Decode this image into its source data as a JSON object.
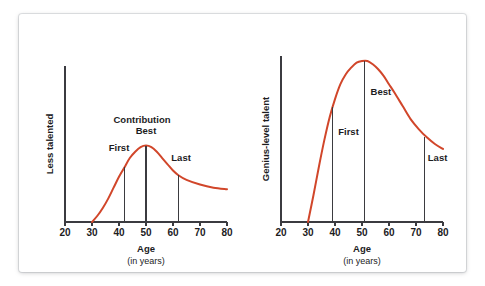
{
  "figure": {
    "background_color": "#ffffff",
    "card_color": "#ffffff",
    "curve_color": "#d1462a",
    "axis_color": "#3b3b40",
    "text_color": "#1c1c1e"
  },
  "chart_data": [
    {
      "type": "line",
      "panel": "left",
      "title": "",
      "xlabel": "Age",
      "xlabel_sub": "(in years)",
      "ylabel": "Less talented",
      "region_label": "Contribution",
      "xlim": [
        20,
        80
      ],
      "ylim": [
        0,
        100
      ],
      "grid": false,
      "legend": "none",
      "xticks": [
        20,
        30,
        40,
        50,
        60,
        70,
        80
      ],
      "xtick_labels": [
        "20",
        "30",
        "40",
        "50",
        "60",
        "70",
        "80"
      ],
      "yticks": [],
      "ytick_labels": [],
      "x": [
        30,
        32,
        34,
        36,
        38,
        40,
        42,
        44,
        46,
        48,
        50,
        52,
        54,
        56,
        58,
        60,
        62,
        65,
        70,
        75,
        80
      ],
      "values": [
        0,
        4,
        9,
        15,
        22,
        29,
        35,
        41,
        45,
        48,
        49,
        48,
        45,
        41,
        37,
        33,
        30,
        27,
        24,
        22,
        21
      ],
      "annotations": [
        {
          "label": "First",
          "x": 42,
          "y": 35,
          "label_x": 40,
          "label_dy": -16
        },
        {
          "label": "Best",
          "x": 50,
          "y": 49,
          "label_x": 50,
          "label_dy": -12
        },
        {
          "label": "Last",
          "x": 62,
          "y": 30,
          "label_x": 63,
          "label_dy": -14
        }
      ]
    },
    {
      "type": "line",
      "panel": "right",
      "title": "",
      "xlabel": "Age",
      "xlabel_sub": "(in years)",
      "ylabel": "Genius-level talent",
      "region_label": "",
      "xlim": [
        20,
        80
      ],
      "ylim": [
        0,
        100
      ],
      "grid": false,
      "legend": "none",
      "xticks": [
        20,
        30,
        40,
        50,
        60,
        70,
        80
      ],
      "xtick_labels": [
        "20",
        "30",
        "40",
        "50",
        "60",
        "70",
        "80"
      ],
      "yticks": [],
      "ytick_labels": [],
      "x": [
        30,
        32,
        34,
        36,
        38,
        40,
        42,
        44,
        46,
        48,
        50,
        52,
        54,
        56,
        58,
        60,
        62,
        65,
        68,
        71,
        74,
        77,
        80
      ],
      "values": [
        0,
        16,
        33,
        49,
        63,
        74,
        83,
        89,
        93,
        96,
        97,
        97,
        95,
        92,
        88,
        83,
        78,
        70,
        62,
        56,
        51,
        47,
        44
      ],
      "annotations": [
        {
          "label": "First",
          "x": 39,
          "y": 69,
          "label_x": 45,
          "label_dy": 28
        },
        {
          "label": "Best",
          "x": 51,
          "y": 97,
          "label_x": 57,
          "label_dy": 34
        },
        {
          "label": "Last",
          "x": 73,
          "y": 51,
          "label_x": 78,
          "label_dy": 24
        }
      ]
    }
  ]
}
